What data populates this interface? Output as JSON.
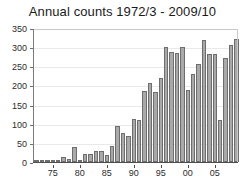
{
  "chart_data": {
    "type": "bar",
    "title": "Annual counts 1972/3 - 2009/10",
    "xlabel": "",
    "ylabel": "",
    "ylim": [
      0,
      350
    ],
    "yticks": [
      0,
      50,
      100,
      150,
      200,
      250,
      300,
      350
    ],
    "ytick_labels": [
      "0",
      "50",
      "100",
      "150",
      "200",
      "250",
      "300",
      "350"
    ],
    "xtick_labels": [
      "75",
      "80",
      "85",
      "90",
      "95",
      "00",
      "05"
    ],
    "xtick_categories": [
      "1975/6",
      "1980/1",
      "1985/6",
      "1990/1",
      "1995/6",
      "2000/1",
      "2005/6"
    ],
    "grid": true,
    "legend": null,
    "bar_color": "#a9a9a9",
    "bar_edge_color": "#6e6e6e",
    "categories": [
      "1972/3",
      "1973/4",
      "1974/5",
      "1975/6",
      "1976/7",
      "1977/8",
      "1978/9",
      "1979/80",
      "1980/1",
      "1981/2",
      "1982/3",
      "1983/4",
      "1984/5",
      "1985/6",
      "1986/7",
      "1987/8",
      "1988/9",
      "1989/90",
      "1990/1",
      "1991/2",
      "1992/3",
      "1993/4",
      "1994/5",
      "1995/6",
      "1996/7",
      "1997/8",
      "1998/9",
      "1999/00",
      "2000/1",
      "2001/2",
      "2002/3",
      "2003/4",
      "2004/5",
      "2005/6",
      "2006/7",
      "2007/8",
      "2008/9",
      "2009/10"
    ],
    "values": [
      2,
      3,
      4,
      5,
      6,
      12,
      8,
      40,
      6,
      20,
      22,
      30,
      28,
      18,
      42,
      93,
      76,
      69,
      112,
      109,
      185,
      206,
      183,
      220,
      300,
      288,
      284,
      301,
      188,
      231,
      255,
      318,
      281,
      282,
      110,
      271,
      305,
      321
    ]
  }
}
